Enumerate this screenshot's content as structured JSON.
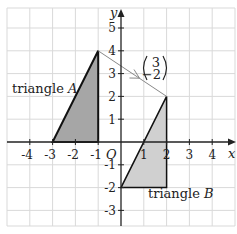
{
  "diagram": {
    "type": "coordinate-grid-translation",
    "grid": {
      "x_min": -5,
      "x_max": 5,
      "y_min": -4,
      "y_max": 5
    },
    "axes": {
      "x_label": "x",
      "y_label": "y",
      "origin_label": "O"
    },
    "x_ticks": [
      "-4",
      "-3",
      "-2",
      "-1",
      "1",
      "2",
      "3",
      "4"
    ],
    "y_ticks": [
      "5",
      "4",
      "3",
      "2",
      "1",
      "-1",
      "-2",
      "-3"
    ],
    "triangle_a": {
      "label_prefix": "triangle ",
      "label_name": "A",
      "vertices": [
        [
          -3,
          0
        ],
        [
          -1,
          0
        ],
        [
          -1,
          4
        ]
      ],
      "fill": "#a6a6a6"
    },
    "triangle_b": {
      "label_prefix": "triangle ",
      "label_name": "B",
      "vertices": [
        [
          0,
          -2
        ],
        [
          2,
          -2
        ],
        [
          2,
          2
        ]
      ],
      "fill": "#d0d0d0"
    },
    "translation_vector": {
      "top": "3",
      "bottom": "−2",
      "from": [
        -1,
        4
      ],
      "to": [
        2,
        2
      ]
    },
    "colors": {
      "grid": "#d9d9d9",
      "axis": "#222222",
      "arrow": "#888888"
    }
  }
}
